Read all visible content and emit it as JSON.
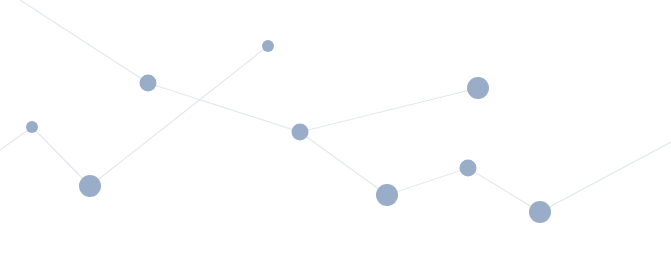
{
  "diagram": {
    "type": "network-graph",
    "background": "#ffffff",
    "node_color": "#9aadc8",
    "edge_color": "#e3e8ee",
    "nodes": [
      {
        "id": "n1",
        "x": 32,
        "y": 127,
        "r": 6
      },
      {
        "id": "n2",
        "x": 90,
        "y": 186,
        "r": 11
      },
      {
        "id": "n3",
        "x": 148,
        "y": 83,
        "r": 8.5
      },
      {
        "id": "n4",
        "x": 268,
        "y": 46,
        "r": 6
      },
      {
        "id": "n5",
        "x": 300,
        "y": 132,
        "r": 8.5
      },
      {
        "id": "n6",
        "x": 387,
        "y": 195,
        "r": 11
      },
      {
        "id": "n7",
        "x": 468,
        "y": 168,
        "r": 8.5
      },
      {
        "id": "n8",
        "x": 478,
        "y": 88,
        "r": 11
      },
      {
        "id": "n9",
        "x": 540,
        "y": 212,
        "r": 11
      }
    ],
    "edges": [
      {
        "from": [
          0,
          150
        ],
        "to": [
          32,
          127
        ]
      },
      {
        "from": [
          32,
          127
        ],
        "to": [
          90,
          186
        ]
      },
      {
        "from": [
          90,
          186
        ],
        "to": [
          268,
          46
        ]
      },
      {
        "from": [
          20,
          0
        ],
        "to": [
          148,
          83
        ]
      },
      {
        "from": [
          148,
          83
        ],
        "to": [
          300,
          132
        ]
      },
      {
        "from": [
          300,
          132
        ],
        "to": [
          478,
          88
        ]
      },
      {
        "from": [
          300,
          132
        ],
        "to": [
          387,
          195
        ]
      },
      {
        "from": [
          387,
          195
        ],
        "to": [
          468,
          168
        ]
      },
      {
        "from": [
          468,
          168
        ],
        "to": [
          540,
          212
        ]
      },
      {
        "from": [
          540,
          212
        ],
        "to": [
          671,
          142
        ]
      }
    ]
  }
}
